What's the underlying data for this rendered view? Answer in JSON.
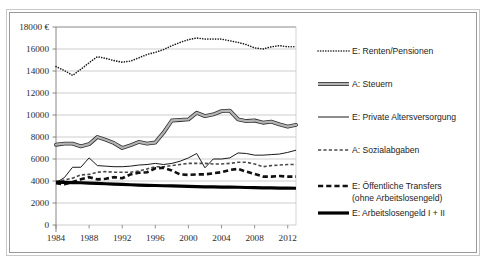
{
  "chart_data": {
    "type": "line",
    "title": "",
    "subtitle": "",
    "xlabel": "",
    "ylabel": "",
    "y_unit": "€",
    "xlim": [
      1984,
      2013
    ],
    "ylim": [
      0,
      18000
    ],
    "ytick_step": 2000,
    "grid": "horizontal",
    "legend_position": "right",
    "ytick_labels": [
      "18000 €",
      "16000",
      "14000",
      "12000",
      "10000",
      "8000",
      "6000",
      "4000",
      "2000",
      "0"
    ],
    "ytick_values": [
      18000,
      16000,
      14000,
      12000,
      10000,
      8000,
      6000,
      4000,
      2000,
      0
    ],
    "xtick_labels": [
      "1984",
      "1988",
      "1992",
      "1996",
      "2000",
      "2004",
      "2008",
      "2012"
    ],
    "xtick_values": [
      1984,
      1988,
      1992,
      1996,
      2000,
      2004,
      2008,
      2012
    ],
    "x": [
      1984,
      1985,
      1986,
      1987,
      1988,
      1989,
      1990,
      1991,
      1992,
      1993,
      1994,
      1995,
      1996,
      1997,
      1998,
      1999,
      2000,
      2001,
      2002,
      2003,
      2004,
      2005,
      2006,
      2007,
      2008,
      2009,
      2010,
      2011,
      2012,
      2013
    ],
    "series": [
      {
        "name": "E: Renten/Pensionen",
        "key": "renten",
        "style": "dotted",
        "color": "#1a1a1a",
        "width": 1.6,
        "values": [
          14400,
          14050,
          13600,
          14150,
          14750,
          15300,
          15150,
          14950,
          14800,
          14900,
          15200,
          15500,
          15700,
          15950,
          16300,
          16600,
          16850,
          17000,
          16900,
          16900,
          16900,
          16750,
          16600,
          16400,
          16100,
          16000,
          16200,
          16300,
          16200,
          16200
        ]
      },
      {
        "name": "A: Steuern",
        "key": "steuern",
        "style": "thick-gray",
        "color": "#6e6e6e",
        "width": 3.0,
        "values": [
          7300,
          7400,
          7400,
          7150,
          7350,
          8000,
          7750,
          7450,
          7000,
          7250,
          7550,
          7400,
          7500,
          8400,
          9500,
          9550,
          9600,
          10200,
          9900,
          10050,
          10350,
          10400,
          9600,
          9450,
          9500,
          9300,
          9400,
          9150,
          8950,
          9100
        ]
      },
      {
        "name": "E: Private Altersversorgung",
        "key": "private",
        "style": "thin-solid",
        "color": "#1a1a1a",
        "width": 1.0,
        "values": [
          3850,
          4300,
          5250,
          5250,
          6100,
          5400,
          5350,
          5300,
          5300,
          5350,
          5450,
          5500,
          5600,
          5500,
          5600,
          5800,
          6100,
          6500,
          5200,
          6000,
          6000,
          6100,
          6550,
          6500,
          6350,
          6350,
          6400,
          6450,
          6600,
          6800
        ]
      },
      {
        "name": "A: Sozialabgaben",
        "key": "sozialabgaben",
        "style": "small-dash",
        "color": "#4a4a4a",
        "width": 1.6,
        "values": [
          3900,
          4100,
          4250,
          4550,
          4600,
          4800,
          4850,
          4800,
          4800,
          4800,
          4900,
          5100,
          5300,
          5300,
          5400,
          5500,
          5600,
          5600,
          5600,
          5550,
          5550,
          5600,
          5700,
          5700,
          5550,
          5300,
          5400,
          5450,
          5500,
          5500
        ]
      },
      {
        "name": "E: Öffentliche Transfers (ohne Arbeitslosengeld)",
        "key": "transfers",
        "style": "bold-dash",
        "color": "#111111",
        "width": 2.6,
        "values": [
          3800,
          3700,
          3900,
          4150,
          4350,
          4150,
          4200,
          4350,
          4250,
          4600,
          4750,
          4800,
          5150,
          5200,
          4950,
          4600,
          4550,
          4600,
          4600,
          4700,
          4800,
          5000,
          5100,
          4850,
          4650,
          4400,
          4400,
          4450,
          4400,
          4400
        ]
      },
      {
        "name": "E: Arbeitslosengeld I + II",
        "key": "arbeitslosengeld",
        "style": "thick-black",
        "color": "#000000",
        "width": 3.2,
        "values": [
          3900,
          3880,
          3860,
          3840,
          3810,
          3780,
          3750,
          3720,
          3690,
          3660,
          3630,
          3610,
          3590,
          3570,
          3550,
          3530,
          3510,
          3490,
          3470,
          3460,
          3450,
          3440,
          3430,
          3410,
          3390,
          3380,
          3370,
          3360,
          3350,
          3340
        ]
      }
    ]
  },
  "legend": {
    "items": [
      {
        "label": "E: Renten/Pensionen",
        "key": "renten"
      },
      {
        "label": "A: Steuern",
        "key": "steuern"
      },
      {
        "label": "E: Private Altersversorgung",
        "key": "private"
      },
      {
        "label": "A: Sozialabgaben",
        "key": "sozialabgaben"
      },
      {
        "label": "E: Öffentliche Transfers",
        "label2": "(ohne Arbeitslosengeld)",
        "key": "transfers"
      },
      {
        "label": "E: Arbeitslosengeld I + II",
        "key": "arbeitslosengeld"
      }
    ]
  },
  "colors": {
    "plot_border": "#8c8c8c",
    "gridline": "#c0c0c0",
    "axis": "#7a7a7a",
    "frame_outer": "#c8c8c8",
    "frame_inner": "#9a9a9a",
    "text": "#1c1c1c",
    "background": "#ffffff"
  }
}
